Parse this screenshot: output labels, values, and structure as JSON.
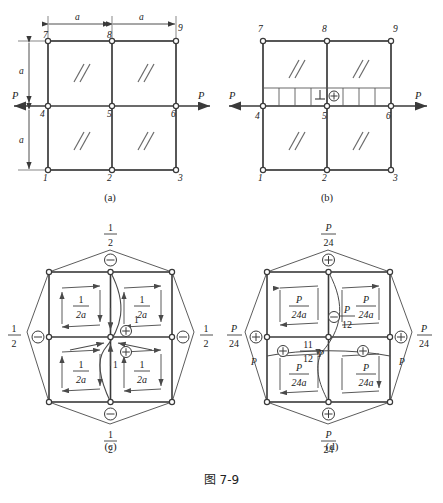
{
  "figure": {
    "caption": "图 7-9",
    "panels": [
      {
        "id": "a",
        "caption": "(a)"
      },
      {
        "id": "b",
        "caption": "(b)"
      },
      {
        "id": "c",
        "caption": "(c)"
      },
      {
        "id": "d",
        "caption": "(d)"
      }
    ]
  },
  "panel_a": {
    "caption": "(a)",
    "nodes": [
      "1",
      "2",
      "3",
      "4",
      "5",
      "6",
      "7",
      "8",
      "9"
    ],
    "dim_top_left": "a",
    "dim_top_right": "a",
    "dim_left_upper": "a",
    "dim_left_lower": "a",
    "load_left": "P",
    "load_right": "P",
    "cell_symbol": "//"
  },
  "panel_b": {
    "caption": "(b)",
    "nodes": [
      "1",
      "2",
      "3",
      "4",
      "5",
      "6",
      "7",
      "8",
      "9"
    ],
    "load_left": "P",
    "load_right": "P",
    "cell_symbol": "//",
    "strip_marker": "⊕",
    "strip_segments": 8
  },
  "panel_c": {
    "caption": "(c)",
    "cell_values": [
      "1/2a",
      "1/2a",
      "1/2a",
      "1/2a"
    ],
    "cell_num": "1",
    "cell_den": "2a",
    "edge_top": "1/2",
    "edge_bottom": "1/2",
    "edge_left": "1/2",
    "edge_right": "1/2",
    "edge_num": "1",
    "edge_den": "2",
    "center_upper_label": "1",
    "center_lower_label": "1",
    "minus_symbol": "⊖",
    "plus_symbol": "⊕"
  },
  "panel_d": {
    "caption": "(d)",
    "cell_num": "P",
    "cell_den": "24a",
    "edge_num": "P",
    "edge_den": "24",
    "diag_num": "P",
    "diag_den": "12",
    "center_num": "11",
    "center_den": "12",
    "center_suffix": "P",
    "side_label": "P",
    "minus_symbol": "⊖",
    "plus_symbol": "⊕"
  },
  "colors": {
    "line": "#3a3a3a",
    "text": "#222222",
    "node_fill": "#ffffff",
    "background": "#ffffff"
  }
}
